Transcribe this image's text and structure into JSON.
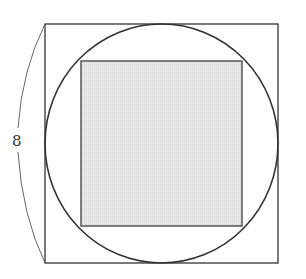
{
  "diagram": {
    "outer_square": {
      "side_label": "8",
      "stroke": "#333333"
    },
    "circle": {
      "stroke": "#333333"
    },
    "inner_square": {
      "fill": "#e4e4e4",
      "stroke": "#555555",
      "shaded": true
    },
    "dimension_brace": {
      "label": "8",
      "side": "left"
    }
  }
}
